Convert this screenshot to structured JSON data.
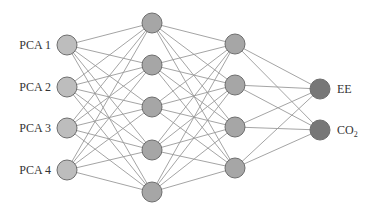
{
  "diagram": {
    "type": "neural-network",
    "layers": [
      {
        "name": "input",
        "x": 67,
        "ys": [
          45,
          87,
          128,
          170
        ],
        "labels": [
          "PCA 1",
          "PCA 2",
          "PCA 3",
          "PCA 4"
        ],
        "fill": "#bdbdbd"
      },
      {
        "name": "hidden-1",
        "x": 152,
        "ys": [
          23,
          65,
          107,
          150,
          192
        ],
        "labels": [],
        "fill": "#a6a6a6"
      },
      {
        "name": "hidden-2",
        "x": 235,
        "ys": [
          44,
          85,
          127,
          168
        ],
        "labels": [],
        "fill": "#a6a6a6"
      },
      {
        "name": "output",
        "x": 320,
        "ys": [
          89,
          130
        ],
        "labels": [
          "EE",
          "CO2"
        ],
        "fill": "#777777"
      }
    ],
    "node_radius": 10,
    "edge_color": "#9a9a9a",
    "node_stroke": "#6e6e6e"
  }
}
